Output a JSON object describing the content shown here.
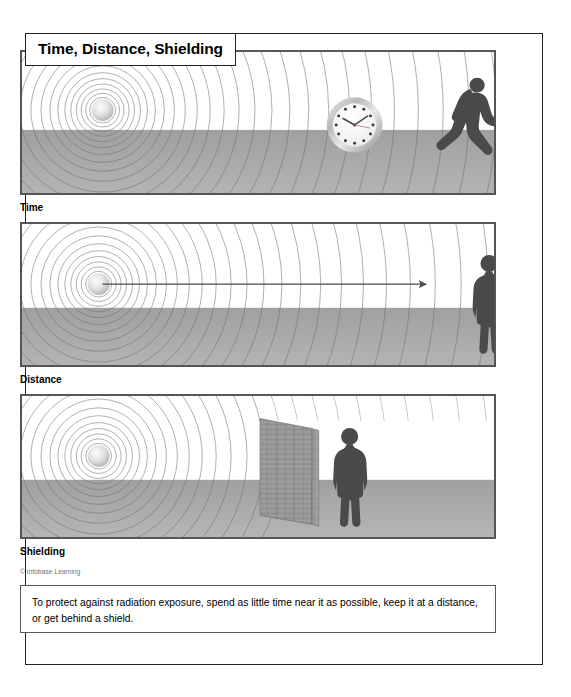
{
  "figure": {
    "title": "Time, Distance, Shielding",
    "credit": "© Infobase Learning",
    "caption": "To protect against radiation exposure, spend as little time near it as possible, keep it at a distance, or get behind a shield."
  },
  "panels": [
    {
      "id": "time",
      "label": "Time",
      "elements": [
        "radiation-source",
        "concentric-waves",
        "wall-clock",
        "running-person",
        "ground"
      ]
    },
    {
      "id": "distance",
      "label": "Distance",
      "elements": [
        "radiation-source",
        "concentric-waves",
        "distance-arrow",
        "standing-person",
        "ground"
      ]
    },
    {
      "id": "shielding",
      "label": "Shielding",
      "elements": [
        "radiation-source",
        "concentric-waves",
        "brick-shield-wall",
        "standing-person",
        "ground"
      ]
    }
  ],
  "clock": {
    "hour_marks": 12,
    "hour_hand_time": "10",
    "minute_hand_time": "2"
  },
  "colors": {
    "border": "#231f20",
    "panel_border": "#555555",
    "ground": "#a9a9a9",
    "wave_line": "#6f6f6f",
    "figure": "#4a4a4a",
    "source_glow": "#d8d8d8",
    "brick": "#9a9a9a",
    "text": "#000000",
    "credit_text": "#6d6e71"
  }
}
